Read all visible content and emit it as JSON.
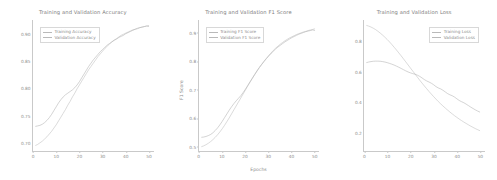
{
  "figure": {
    "background": "#ffffff",
    "line_color_train": "#bdbdbd",
    "line_color_val": "#b0b0b0",
    "axis_color": "#c9c9c9",
    "text_color": "#8d8d8d"
  },
  "chart_data": [
    {
      "type": "line",
      "title": "Training and Validation Accuracy",
      "xlabel": "",
      "ylabel": "",
      "xlim": [
        0,
        52
      ],
      "ylim": [
        0.685,
        0.925
      ],
      "grid": false,
      "legend_position": "upper left",
      "xticks": [
        "0",
        "10",
        "20",
        "30",
        "40",
        "50"
      ],
      "xtick_values": [
        0,
        10,
        20,
        30,
        40,
        50
      ],
      "yticks": [
        "0.70",
        "0.75",
        "0.80",
        "0.85",
        "0.90"
      ],
      "ytick_values": [
        0.7,
        0.75,
        0.8,
        0.85,
        0.9
      ],
      "x": [
        1,
        2,
        3,
        4,
        5,
        6,
        7,
        8,
        9,
        10,
        11,
        12,
        13,
        14,
        15,
        16,
        17,
        18,
        19,
        20,
        21,
        22,
        23,
        24,
        25,
        26,
        27,
        28,
        29,
        30,
        31,
        32,
        33,
        34,
        35,
        36,
        37,
        38,
        39,
        40,
        41,
        42,
        43,
        44,
        45,
        46,
        47,
        48,
        49,
        50
      ],
      "series": [
        {
          "name": "Training Accuracy",
          "values": [
            0.695,
            0.697,
            0.7,
            0.703,
            0.707,
            0.711,
            0.716,
            0.721,
            0.727,
            0.733,
            0.74,
            0.747,
            0.754,
            0.761,
            0.769,
            0.776,
            0.784,
            0.791,
            0.799,
            0.806,
            0.813,
            0.82,
            0.827,
            0.834,
            0.84,
            0.846,
            0.852,
            0.858,
            0.863,
            0.868,
            0.873,
            0.877,
            0.881,
            0.885,
            0.888,
            0.891,
            0.894,
            0.897,
            0.899,
            0.901,
            0.903,
            0.905,
            0.907,
            0.908,
            0.91,
            0.911,
            0.912,
            0.913,
            0.914,
            0.915
          ]
        },
        {
          "name": "Validation Accuracy",
          "values": [
            0.73,
            0.731,
            0.732,
            0.734,
            0.737,
            0.741,
            0.746,
            0.752,
            0.759,
            0.766,
            0.773,
            0.779,
            0.784,
            0.788,
            0.791,
            0.794,
            0.797,
            0.801,
            0.806,
            0.812,
            0.819,
            0.826,
            0.833,
            0.84,
            0.846,
            0.852,
            0.857,
            0.862,
            0.867,
            0.871,
            0.875,
            0.879,
            0.882,
            0.885,
            0.888,
            0.89,
            0.893,
            0.895,
            0.897,
            0.9,
            0.902,
            0.904,
            0.906,
            0.908,
            0.909,
            0.911,
            0.912,
            0.913,
            0.914,
            0.913
          ]
        }
      ]
    },
    {
      "type": "line",
      "title": "Training and Validation F1 Score",
      "xlabel": "Epochs",
      "ylabel": "F1 Score",
      "xlim": [
        0,
        52
      ],
      "ylim": [
        0.485,
        0.945
      ],
      "grid": false,
      "legend_position": "upper left",
      "xticks": [
        "0",
        "10",
        "20",
        "30",
        "40",
        "50"
      ],
      "xtick_values": [
        0,
        10,
        20,
        30,
        40,
        50
      ],
      "yticks": [
        "0.9",
        "0.8",
        "0.7",
        "0.6",
        "0.5"
      ],
      "ytick_values": [
        0.9,
        0.8,
        0.7,
        0.6,
        0.5
      ],
      "x": [
        1,
        2,
        3,
        4,
        5,
        6,
        7,
        8,
        9,
        10,
        11,
        12,
        13,
        14,
        15,
        16,
        17,
        18,
        19,
        20,
        21,
        22,
        23,
        24,
        25,
        26,
        27,
        28,
        29,
        30,
        31,
        32,
        33,
        34,
        35,
        36,
        37,
        38,
        39,
        40,
        41,
        42,
        43,
        44,
        45,
        46,
        47,
        48,
        49,
        50
      ],
      "series": [
        {
          "name": "Training F1 Score",
          "values": [
            0.5,
            0.503,
            0.507,
            0.512,
            0.518,
            0.525,
            0.533,
            0.542,
            0.552,
            0.563,
            0.575,
            0.588,
            0.601,
            0.615,
            0.629,
            0.643,
            0.657,
            0.671,
            0.685,
            0.699,
            0.713,
            0.727,
            0.74,
            0.753,
            0.766,
            0.778,
            0.789,
            0.8,
            0.81,
            0.82,
            0.829,
            0.838,
            0.846,
            0.853,
            0.86,
            0.866,
            0.872,
            0.877,
            0.882,
            0.886,
            0.89,
            0.894,
            0.897,
            0.9,
            0.903,
            0.905,
            0.908,
            0.91,
            0.912,
            0.914
          ]
        },
        {
          "name": "Validation F1 Score",
          "values": [
            0.533,
            0.534,
            0.536,
            0.539,
            0.543,
            0.549,
            0.557,
            0.566,
            0.577,
            0.589,
            0.602,
            0.615,
            0.628,
            0.64,
            0.651,
            0.661,
            0.67,
            0.679,
            0.69,
            0.702,
            0.715,
            0.728,
            0.741,
            0.754,
            0.766,
            0.778,
            0.789,
            0.799,
            0.809,
            0.818,
            0.827,
            0.835,
            0.843,
            0.85,
            0.856,
            0.862,
            0.868,
            0.873,
            0.878,
            0.883,
            0.887,
            0.891,
            0.895,
            0.898,
            0.901,
            0.904,
            0.906,
            0.908,
            0.91,
            0.908
          ]
        }
      ]
    },
    {
      "type": "line",
      "title": "Training and Validation Loss",
      "xlabel": "",
      "ylabel": "",
      "xlim": [
        0,
        52
      ],
      "ylim": [
        0.08,
        0.94
      ],
      "grid": false,
      "legend_position": "upper right",
      "xticks": [
        "0",
        "10",
        "20",
        "30",
        "40",
        "50"
      ],
      "xtick_values": [
        0,
        10,
        20,
        30,
        40,
        50
      ],
      "yticks": [
        "0.8",
        "0.6",
        "0.4",
        "0.2"
      ],
      "ytick_values": [
        0.8,
        0.6,
        0.4,
        0.2
      ],
      "x": [
        1,
        2,
        3,
        4,
        5,
        6,
        7,
        8,
        9,
        10,
        11,
        12,
        13,
        14,
        15,
        16,
        17,
        18,
        19,
        20,
        21,
        22,
        23,
        24,
        25,
        26,
        27,
        28,
        29,
        30,
        31,
        32,
        33,
        34,
        35,
        36,
        37,
        38,
        39,
        40,
        41,
        42,
        43,
        44,
        45,
        46,
        47,
        48,
        49,
        50
      ],
      "series": [
        {
          "name": "Training Loss",
          "values": [
            0.905,
            0.9,
            0.894,
            0.886,
            0.877,
            0.866,
            0.854,
            0.841,
            0.827,
            0.812,
            0.796,
            0.779,
            0.761,
            0.743,
            0.724,
            0.705,
            0.685,
            0.665,
            0.645,
            0.625,
            0.605,
            0.585,
            0.565,
            0.545,
            0.526,
            0.507,
            0.489,
            0.471,
            0.454,
            0.437,
            0.421,
            0.405,
            0.39,
            0.376,
            0.362,
            0.349,
            0.336,
            0.324,
            0.312,
            0.301,
            0.29,
            0.28,
            0.27,
            0.261,
            0.252,
            0.243,
            0.235,
            0.227,
            0.22,
            0.213
          ]
        },
        {
          "name": "Validation Loss",
          "values": [
            0.66,
            0.664,
            0.667,
            0.669,
            0.67,
            0.67,
            0.669,
            0.667,
            0.664,
            0.66,
            0.655,
            0.65,
            0.644,
            0.637,
            0.63,
            0.622,
            0.614,
            0.606,
            0.599,
            0.593,
            0.588,
            0.584,
            0.578,
            0.57,
            0.56,
            0.549,
            0.54,
            0.533,
            0.525,
            0.515,
            0.503,
            0.494,
            0.488,
            0.479,
            0.468,
            0.457,
            0.449,
            0.443,
            0.434,
            0.423,
            0.412,
            0.404,
            0.397,
            0.388,
            0.378,
            0.368,
            0.359,
            0.35,
            0.342,
            0.335
          ]
        }
      ]
    }
  ]
}
